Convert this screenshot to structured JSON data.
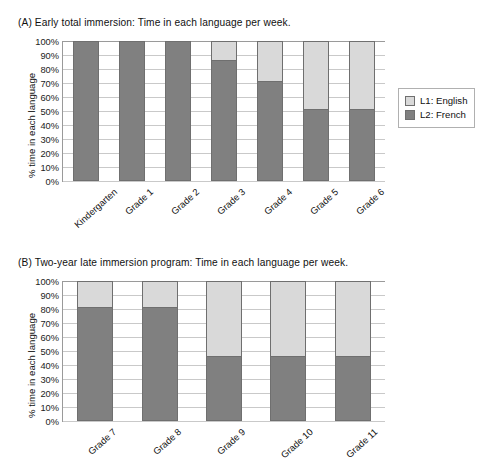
{
  "colors": {
    "l1_english": "#d9d9d9",
    "l2_french": "#808080",
    "axis": "#9a9a9a",
    "grid": "#c9c9c9",
    "bar_outline": "#6f6f6f",
    "text": "#111111",
    "background": "#ffffff"
  },
  "legend": {
    "l1_label": "L1: English",
    "l2_label": "L2: French"
  },
  "panel_a": {
    "title": "(A) Early total immersion: Time in each language per week.",
    "ylabel": "% time in each language",
    "yticks": [
      "100%",
      "90%",
      "80%",
      "70%",
      "60%",
      "50%",
      "40%",
      "30%",
      "20%",
      "10%",
      "0%"
    ]
  },
  "panel_b": {
    "title": "(B) Two-year late immersion program: Time in each language per week.",
    "ylabel": "% time in each language",
    "yticks": [
      "100%",
      "90%",
      "80%",
      "70%",
      "60%",
      "50%",
      "40%",
      "30%",
      "20%",
      "10%",
      "0%"
    ]
  },
  "chart_data": [
    {
      "type": "bar",
      "stacked": true,
      "title": "(A) Early total immersion: Time in each language per week.",
      "xlabel": "",
      "ylabel": "% time in each language",
      "ylim": [
        0,
        100
      ],
      "ytick_step": 10,
      "grid": true,
      "legend_position": "right",
      "categories": [
        "Kindergarten",
        "Grade 1",
        "Grade 2",
        "Grade 3",
        "Grade 4",
        "Grade 5",
        "Grade 6"
      ],
      "series": [
        {
          "name": "L2: French",
          "color": "#808080",
          "values": [
            100,
            100,
            100,
            86,
            71,
            51,
            51
          ]
        },
        {
          "name": "L1: English",
          "color": "#d9d9d9",
          "values": [
            0,
            0,
            0,
            14,
            29,
            49,
            49
          ]
        }
      ]
    },
    {
      "type": "bar",
      "stacked": true,
      "title": "(B) Two-year late immersion program: Time in each language per week.",
      "xlabel": "",
      "ylabel": "% time in each language",
      "ylim": [
        0,
        100
      ],
      "ytick_step": 10,
      "grid": true,
      "legend_position": "right",
      "categories": [
        "Grade 7",
        "Grade 8",
        "Grade 9",
        "Grade 10",
        "Grade 11"
      ],
      "series": [
        {
          "name": "L2: French",
          "color": "#808080",
          "values": [
            81,
            81,
            46,
            46,
            46
          ]
        },
        {
          "name": "L1: English",
          "color": "#d9d9d9",
          "values": [
            19,
            19,
            54,
            54,
            54
          ]
        }
      ]
    }
  ]
}
